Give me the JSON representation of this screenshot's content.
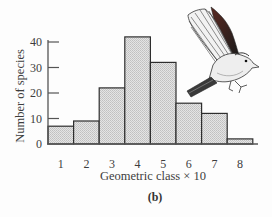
{
  "chart_data": {
    "type": "bar",
    "subtype": "histogram",
    "title": "",
    "panel_label": "(b)",
    "xlabel": "Geometric class × 10",
    "ylabel": "Number of species",
    "categories": [
      "1",
      "2",
      "3",
      "4",
      "5",
      "6",
      "7",
      "8"
    ],
    "values": [
      7,
      9,
      22,
      42,
      32,
      16,
      12,
      2
    ],
    "ylim": [
      0,
      45
    ],
    "yticks": [
      0,
      10,
      20,
      30,
      40
    ],
    "grid": false,
    "legend": null,
    "bar_fill": "stippled light gray",
    "annotations": [
      "illustration of a bird in flight (upper right)"
    ]
  },
  "colors": {
    "axis": "#555555",
    "bar_edge": "#2e2e2e",
    "bar_fill_light": "#e6e6e6",
    "bar_fill_dark": "#c2c2c2",
    "text": "#3d3d3d"
  }
}
